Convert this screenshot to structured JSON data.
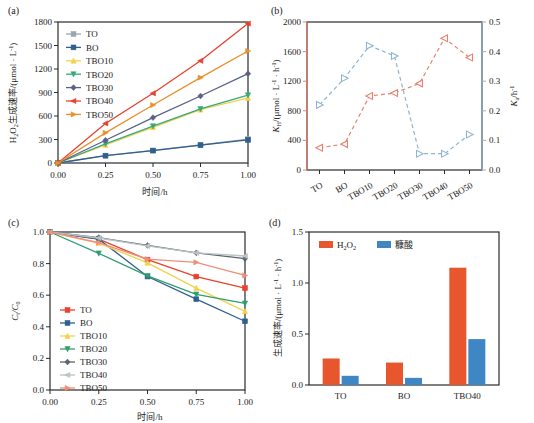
{
  "figure": {
    "panels": [
      {
        "id": "a",
        "label": "(a)"
      },
      {
        "id": "b",
        "label": "(b)"
      },
      {
        "id": "c",
        "label": "(c)"
      },
      {
        "id": "d",
        "label": "(d)"
      }
    ]
  },
  "series_names": [
    "TO",
    "BO",
    "TBO10",
    "TBO20",
    "TBO30",
    "TBO40",
    "TBO50"
  ],
  "colors": {
    "TO_a": "#9aa7ad",
    "BO_a": "#2f5f8f",
    "TBO10_a": "#f2d24b",
    "TBO20_a": "#3aa878",
    "TBO30_a": "#5a5f88",
    "TBO40_a": "#e8412c",
    "TBO50_a": "#e8902a",
    "TO_c": "#e8412c",
    "BO_c": "#2f5f8f",
    "TBO10_c": "#f2d24b",
    "TBO20_c": "#2f9e6e",
    "TBO30_c": "#5b666e",
    "TBO40_c": "#b9c2c4",
    "TBO50_c": "#ef8f7a",
    "kh_red": "#e8806d",
    "ka_blue": "#8fb4cf",
    "bar_h2o2": "#e8562e",
    "bar_furoic": "#3f86c4",
    "axis": "#2b2b2b"
  },
  "panel_a": {
    "label": "(a)",
    "ylabel_parts": {
      "pre": "H",
      "sub1": "2",
      "mid": "O",
      "sub2": "2",
      "post": "生成速率/(μmol · L",
      "sup": "-1",
      "end": ")"
    },
    "xlabel": "时间/h",
    "yticks": [
      "0",
      "300",
      "600",
      "900",
      "1200",
      "1500",
      "1800"
    ],
    "xticks": [
      "0.00",
      "0.25",
      "0.50",
      "0.75",
      "1.00"
    ],
    "ylim": [
      0,
      1800
    ],
    "xlim": [
      0,
      1.0
    ],
    "legend": [
      "TO",
      "BO",
      "TBO10",
      "TBO20",
      "TBO30",
      "TBO40",
      "TBO50"
    ]
  },
  "panel_b": {
    "label": "(b)",
    "ylabel_left": "K",
    "ylabel_left_sub": "H",
    "ylabel_left_rest": "/(μmol · L",
    "ylabel_left_sup1": "-1",
    "ylabel_left_mid": " · h",
    "ylabel_left_sup2": "-1",
    "ylabel_left_end": ")",
    "ylabel_right": "K",
    "ylabel_right_sub": "a",
    "ylabel_right_rest": "/h",
    "ylabel_right_sup": "-1",
    "yticks_left": [
      "0",
      "400",
      "800",
      "1200",
      "1600",
      "2000"
    ],
    "yticks_right": [
      "0.0",
      "0.1",
      "0.2",
      "0.3",
      "0.4",
      "0.5"
    ],
    "xticks": [
      "TO",
      "BO",
      "TBO10",
      "TBO20",
      "TBO30",
      "TBO40",
      "TBO50"
    ],
    "ylim_left": [
      0,
      2000
    ],
    "ylim_right": [
      0.0,
      0.5
    ]
  },
  "panel_c": {
    "label": "(c)",
    "ylabel": "C",
    "ylabel_sub1": "t",
    "ylabel_mid": "/C",
    "ylabel_sub2": "0",
    "xlabel": "时间/h",
    "yticks": [
      "0.0",
      "0.2",
      "0.4",
      "0.6",
      "0.8",
      "1.0"
    ],
    "xticks": [
      "0.00",
      "0.25",
      "0.50",
      "0.75",
      "1.00"
    ],
    "ylim": [
      0,
      1.0
    ],
    "xlim": [
      0,
      1.0
    ],
    "legend": [
      "TO",
      "BO",
      "TBO10",
      "TBO20",
      "TBO30",
      "TBO40",
      "TBO50"
    ]
  },
  "panel_d": {
    "label": "(d)",
    "ylabel": "生成速率/(μmol · L",
    "ylabel_sup1": "-1",
    "ylabel_mid": " · h",
    "ylabel_sup2": "-1",
    "ylabel_end": ")",
    "yticks": [
      "0.0",
      "0.5",
      "1.0",
      "1.5"
    ],
    "xticks": [
      "TO",
      "BO",
      "TBO40"
    ],
    "ylim": [
      0,
      1.5
    ],
    "legend": [
      {
        "label_pre": "H",
        "label_sub1": "2",
        "label_mid": "O",
        "label_sub2": "2",
        "key": "h2o2"
      },
      {
        "label": "糠酸",
        "key": "furoic"
      }
    ]
  },
  "chart_data": [
    {
      "panel": "a",
      "type": "line",
      "title": "(a)",
      "xlabel": "时间/h",
      "ylabel": "H2O2生成速率/(μmol · L-1)",
      "x": [
        0.0,
        0.25,
        0.5,
        0.75,
        1.0
      ],
      "xlim": [
        0,
        1.0
      ],
      "ylim": [
        0,
        1800
      ],
      "grid": false,
      "legend_position": "upper-left",
      "series": [
        {
          "name": "TO",
          "values": [
            0,
            95,
            160,
            230,
            305
          ],
          "color": "#9aa7ad",
          "marker": "square"
        },
        {
          "name": "BO",
          "values": [
            0,
            93,
            158,
            228,
            295
          ],
          "color": "#2f5f8f",
          "marker": "square"
        },
        {
          "name": "TBO10",
          "values": [
            0,
            230,
            455,
            680,
            830
          ],
          "color": "#f2d24b",
          "marker": "triangle-up"
        },
        {
          "name": "TBO20",
          "values": [
            0,
            245,
            470,
            690,
            865
          ],
          "color": "#3aa878",
          "marker": "triangle-down"
        },
        {
          "name": "TBO30",
          "values": [
            0,
            290,
            580,
            855,
            1140
          ],
          "color": "#5a5f88",
          "marker": "diamond"
        },
        {
          "name": "TBO40",
          "values": [
            0,
            505,
            890,
            1305,
            1780
          ],
          "color": "#e8412c",
          "marker": "triangle-left"
        },
        {
          "name": "TBO50",
          "values": [
            0,
            385,
            740,
            1090,
            1430
          ],
          "color": "#e8902a",
          "marker": "triangle-right"
        }
      ]
    },
    {
      "panel": "b",
      "type": "line",
      "title": "(b)",
      "xlabel": "",
      "ylabel_left": "KH/(μmol · L-1 · h-1)",
      "ylabel_right": "Ka/h-1",
      "categories": [
        "TO",
        "BO",
        "TBO10",
        "TBO20",
        "TBO30",
        "TBO40",
        "TBO50"
      ],
      "ylim_left": [
        0,
        2000
      ],
      "ylim_right": [
        0.0,
        0.5
      ],
      "grid": false,
      "legend_position": "none",
      "series": [
        {
          "name": "KH",
          "axis": "left",
          "values": [
            300,
            350,
            1000,
            1040,
            1170,
            1780,
            1520
          ],
          "color": "#e8806d",
          "linestyle": "dashed",
          "marker": "triangle-left"
        },
        {
          "name": "Ka",
          "axis": "right",
          "values": [
            0.22,
            0.31,
            0.42,
            0.385,
            0.055,
            0.055,
            0.12
          ],
          "color": "#8fb4cf",
          "linestyle": "dashed",
          "marker": "triangle-right"
        }
      ]
    },
    {
      "panel": "c",
      "type": "line",
      "title": "(c)",
      "xlabel": "时间/h",
      "ylabel": "Ct/C0",
      "x": [
        0.0,
        0.25,
        0.5,
        0.75,
        1.0
      ],
      "xlim": [
        0,
        1.0
      ],
      "ylim": [
        0,
        1.0
      ],
      "grid": false,
      "legend_position": "lower-left",
      "series": [
        {
          "name": "TO",
          "values": [
            1.0,
            0.955,
            0.825,
            0.718,
            0.645
          ],
          "color": "#e8412c",
          "marker": "square"
        },
        {
          "name": "BO",
          "values": [
            1.0,
            0.955,
            0.718,
            0.575,
            0.435
          ],
          "color": "#2f5f8f",
          "marker": "square"
        },
        {
          "name": "TBO10",
          "values": [
            1.0,
            0.93,
            0.805,
            0.645,
            0.498
          ],
          "color": "#f2d24b",
          "marker": "triangle-up"
        },
        {
          "name": "TBO20",
          "values": [
            1.0,
            0.865,
            0.722,
            0.605,
            0.548
          ],
          "color": "#2f9e6e",
          "marker": "triangle-down"
        },
        {
          "name": "TBO30",
          "values": [
            1.0,
            0.965,
            0.915,
            0.868,
            0.832
          ],
          "color": "#5b666e",
          "marker": "diamond"
        },
        {
          "name": "TBO40",
          "values": [
            1.0,
            0.962,
            0.912,
            0.868,
            0.848
          ],
          "color": "#b9c2c4",
          "marker": "triangle-left"
        },
        {
          "name": "TBO50",
          "values": [
            1.0,
            0.932,
            0.828,
            0.808,
            0.725
          ],
          "color": "#ef8f7a",
          "marker": "triangle-right"
        }
      ]
    },
    {
      "panel": "d",
      "type": "bar",
      "title": "(d)",
      "xlabel": "",
      "ylabel": "生成速率/(μmol · L-1 · h-1)",
      "categories": [
        "TO",
        "BO",
        "TBO40"
      ],
      "ylim": [
        0,
        1.5
      ],
      "grid": false,
      "legend_position": "upper-left",
      "series": [
        {
          "name": "H2O2",
          "values": [
            0.26,
            0.22,
            1.15
          ],
          "color": "#e8562e"
        },
        {
          "name": "糠酸",
          "values": [
            0.09,
            0.07,
            0.45
          ],
          "color": "#3f86c4"
        }
      ]
    }
  ]
}
